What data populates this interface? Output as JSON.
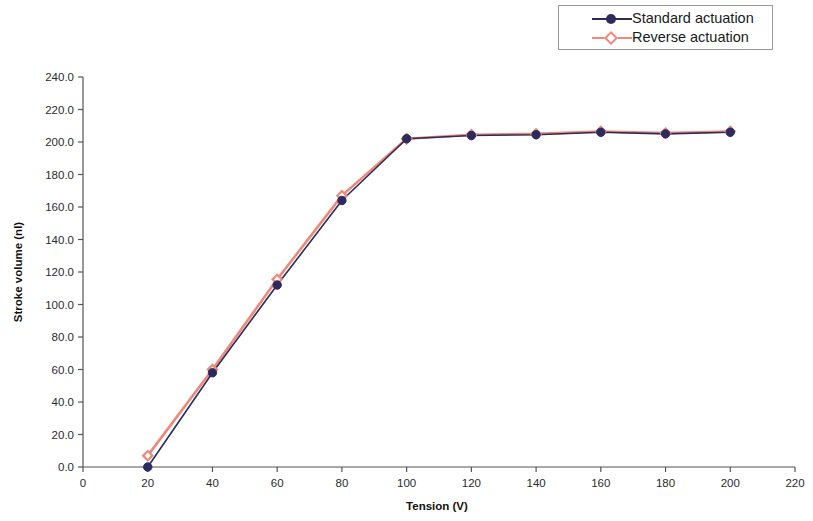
{
  "chart_data": {
    "type": "line",
    "title": "",
    "xlabel": "Tension (V)",
    "ylabel": "Stroke volume (nl)",
    "xlim": [
      0,
      220
    ],
    "ylim": [
      0,
      240
    ],
    "xticks": [
      0,
      20,
      40,
      60,
      80,
      100,
      120,
      140,
      160,
      180,
      200,
      220
    ],
    "xtick_labels": [
      "0",
      "20",
      "40",
      "60",
      "80",
      "100",
      "120",
      "140",
      "160",
      "180",
      "200",
      "220"
    ],
    "yticks": [
      0,
      20,
      40,
      60,
      80,
      100,
      120,
      140,
      160,
      180,
      200,
      220,
      240
    ],
    "ytick_labels": [
      "0.0",
      "20.0",
      "40.0",
      "60.0",
      "80.0",
      "100.0",
      "120.0",
      "140.0",
      "160.0",
      "180.0",
      "200.0",
      "220.0",
      "240.0"
    ],
    "grid": false,
    "legend_position": "top-right",
    "x": [
      20,
      40,
      60,
      80,
      100,
      120,
      140,
      160,
      180,
      200
    ],
    "series": [
      {
        "name": "Standard actuation",
        "color": "#2b2b5e",
        "marker": "circle",
        "values": [
          0.0,
          58.0,
          112.0,
          164.0,
          202.0,
          204.0,
          204.5,
          206.0,
          205.0,
          206.0
        ]
      },
      {
        "name": "Reverse actuation",
        "color": "#f08878",
        "marker": "diamond",
        "values": [
          7.0,
          60.0,
          115.5,
          167.0,
          202.0,
          204.5,
          205.0,
          206.5,
          205.5,
          206.5
        ]
      }
    ]
  },
  "legend": {
    "entries": [
      {
        "label": "Standard actuation"
      },
      {
        "label": "Reverse actuation"
      }
    ]
  },
  "axes": {
    "x_title": "Tension (V)",
    "y_title": "Stroke volume (nl)"
  },
  "colors": {
    "standard": "#2b2b5e",
    "reverse": "#f08878",
    "axis": "#555555"
  }
}
